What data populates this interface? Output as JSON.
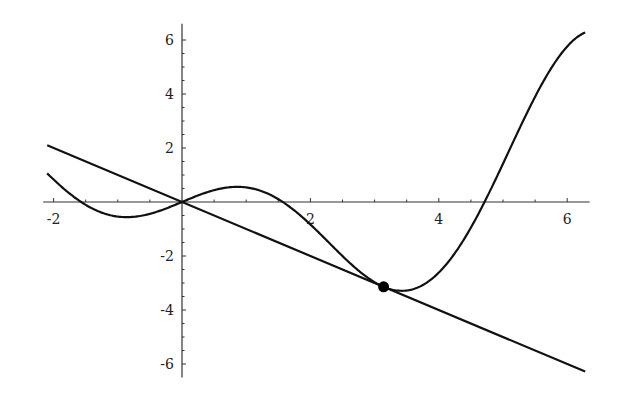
{
  "chart_data": {
    "type": "line",
    "title": "",
    "xlabel": "",
    "ylabel": "",
    "xlim": [
      -2.1,
      6.35
    ],
    "ylim": [
      -6.5,
      6.6
    ],
    "grid": false,
    "legend": null,
    "x_ticks": [
      -2,
      2,
      4,
      6
    ],
    "x_tick_labels": [
      "-2",
      "2",
      "4",
      "6"
    ],
    "y_ticks": [
      6,
      4,
      2,
      -2,
      -4,
      -6
    ],
    "y_tick_labels": [
      "6",
      "4",
      "2",
      "-2",
      "-4",
      "-6"
    ],
    "series": [
      {
        "name": "curve",
        "function": "x*cos(x)",
        "x": [
          -2.1,
          -1.8,
          -1.5,
          -1.2,
          -0.9,
          -0.6,
          -0.3,
          0,
          0.3,
          0.6,
          0.9,
          1.2,
          1.5,
          1.8,
          2.1,
          2.4,
          2.7,
          3.0,
          3.3,
          3.6,
          3.9,
          4.2,
          4.5,
          4.8,
          5.1,
          5.4,
          5.7,
          6.0,
          6.28
        ],
        "values": [
          1.06,
          0.41,
          -0.11,
          -0.43,
          -0.56,
          -0.5,
          -0.29,
          0,
          0.29,
          0.5,
          0.56,
          0.43,
          0.11,
          -0.41,
          -1.06,
          -1.77,
          -2.44,
          -2.97,
          -3.25,
          -3.23,
          -2.84,
          -2.06,
          -0.95,
          0.42,
          1.93,
          3.45,
          4.75,
          5.76,
          6.28
        ]
      },
      {
        "name": "tangent-line",
        "function": "-x",
        "x": [
          -2.1,
          6.28
        ],
        "values": [
          2.1,
          -6.28
        ]
      }
    ],
    "annotations": [
      {
        "type": "point",
        "x": 3.14,
        "y": -3.14,
        "label": ""
      }
    ]
  }
}
